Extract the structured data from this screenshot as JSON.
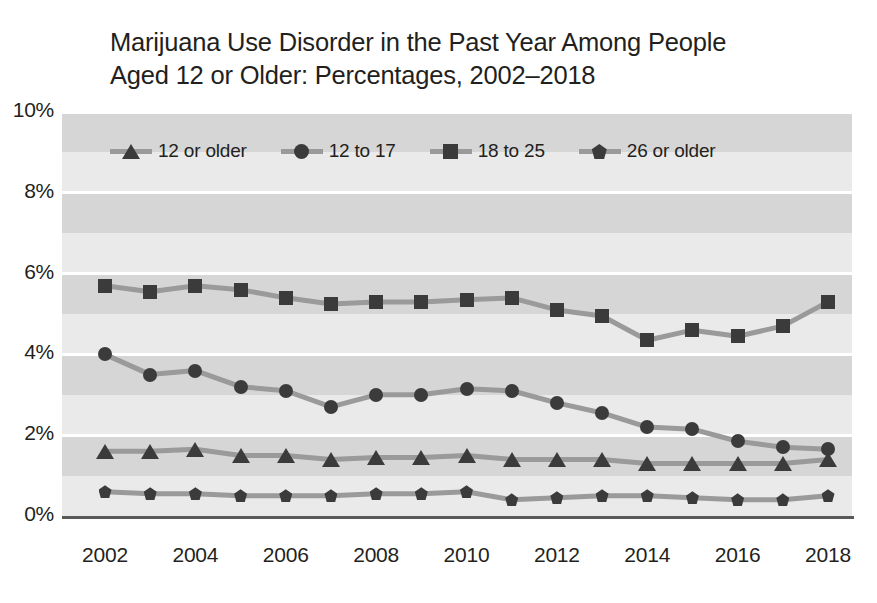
{
  "chart_data": {
    "type": "line",
    "title": "Marijuana Use Disorder in the Past Year Among People Aged 12 or Older: Percentages, 2002–2018",
    "title_line1": "Marijuana Use Disorder in the Past Year Among People",
    "title_line2": "Aged 12 or Older: Percentages, 2002–2018",
    "xlabel": "",
    "ylabel": "",
    "ylim": [
      0,
      10
    ],
    "yticks": [
      "0%",
      "2%",
      "4%",
      "6%",
      "8%",
      "10%"
    ],
    "ytick_values": [
      0,
      2,
      4,
      6,
      8,
      10
    ],
    "xticks": [
      "2002",
      "2004",
      "2006",
      "2008",
      "2010",
      "2012",
      "2014",
      "2016",
      "2018"
    ],
    "xtick_values": [
      2002,
      2004,
      2006,
      2008,
      2010,
      2012,
      2014,
      2016,
      2018
    ],
    "x": [
      2002,
      2003,
      2004,
      2005,
      2006,
      2007,
      2008,
      2009,
      2010,
      2011,
      2012,
      2013,
      2014,
      2015,
      2016,
      2017,
      2018
    ],
    "grid": true,
    "grid_bands": "alternating horizontal gray bands every 1 percent",
    "legend_position": "top-inside",
    "series": [
      {
        "name": "12 or older",
        "marker": "triangle",
        "values": [
          1.6,
          1.6,
          1.65,
          1.5,
          1.5,
          1.4,
          1.45,
          1.45,
          1.5,
          1.4,
          1.4,
          1.4,
          1.3,
          1.3,
          1.3,
          1.3,
          1.4
        ]
      },
      {
        "name": "12 to 17",
        "marker": "circle",
        "values": [
          4.0,
          3.5,
          3.6,
          3.2,
          3.1,
          2.7,
          3.0,
          3.0,
          3.15,
          3.1,
          2.8,
          2.55,
          2.2,
          2.15,
          1.85,
          1.7,
          1.65
        ]
      },
      {
        "name": "18 to 25",
        "marker": "square",
        "values": [
          5.7,
          5.55,
          5.7,
          5.6,
          5.4,
          5.25,
          5.3,
          5.3,
          5.35,
          5.4,
          5.1,
          4.95,
          4.35,
          4.6,
          4.45,
          4.7,
          5.3
        ]
      },
      {
        "name": "26 or older",
        "marker": "diamond",
        "values": [
          0.6,
          0.55,
          0.55,
          0.5,
          0.5,
          0.5,
          0.55,
          0.55,
          0.6,
          0.4,
          0.45,
          0.5,
          0.5,
          0.45,
          0.4,
          0.4,
          0.5
        ]
      }
    ],
    "colors": {
      "marker": "#3b3b3b",
      "line": "#9a9a9a",
      "band_dark": "#d6d6d6",
      "band_light": "#eaeaea",
      "gridline": "#ffffff",
      "axis": "#58595b",
      "text": "#231f20"
    }
  }
}
